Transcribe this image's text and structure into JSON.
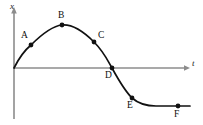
{
  "figure": {
    "kind": "line-graph",
    "background_color": "#ffffff",
    "axis_color": "#8c8c8c",
    "curve_color": "#111111",
    "marker_color": "#111111",
    "label_color": "#0d0d0d"
  },
  "axes": {
    "vertical": {
      "name": "x-axis",
      "label": "x",
      "label_x": 10,
      "label_y": 2,
      "line_x": 14,
      "line_top": 11,
      "line_bottom": 119,
      "has_arrow": true
    },
    "horizontal": {
      "name": "t-axis",
      "label": "t",
      "label_x": 192,
      "label_y": 59,
      "line_y": 68,
      "line_left": 14,
      "line_right": 189,
      "has_arrow": true
    },
    "origin": {
      "x": 14,
      "y": 68
    }
  },
  "chart_data": {
    "type": "line",
    "title": "",
    "xlabel": "t",
    "ylabel": "x",
    "grid": false,
    "legend": null,
    "xlim": [
      0,
      189
    ],
    "ylim": [
      -40,
      60
    ],
    "curve_description": "Displacement x versus time t: rises from the origin to a maximum, falls through zero, and levels off at a constant negative value.",
    "curve_path": "M 14,68 C 20,56 25,50 31,45 C 41,35 52,26 62,25 C 73,24 83,31 94,42 C 104,52 108,61 112,68 C 118,79 125,91 132,98 C 140,105 148,106 156,106 C 166,106 180,106 190,106",
    "points": [
      {
        "id": "A",
        "label": "A",
        "x": 31,
        "y": 45,
        "label_x": 21,
        "label_y": 31,
        "note": "rising, below maximum"
      },
      {
        "id": "B",
        "label": "B",
        "x": 62,
        "y": 25,
        "label_x": 58,
        "label_y": 11,
        "note": "maximum displacement"
      },
      {
        "id": "C",
        "label": "C",
        "x": 94,
        "y": 42,
        "label_x": 98,
        "label_y": 31,
        "note": "falling, above axis"
      },
      {
        "id": "D",
        "label": "D",
        "x": 112,
        "y": 68,
        "label_x": 105,
        "label_y": 71,
        "note": "crosses the t-axis, x = 0"
      },
      {
        "id": "E",
        "label": "E",
        "x": 132,
        "y": 98,
        "label_x": 127,
        "label_y": 101,
        "note": "falling, below axis"
      },
      {
        "id": "F",
        "label": "F",
        "x": 178,
        "y": 106,
        "label_x": 174,
        "label_y": 110,
        "note": "levelled off, constant negative x"
      }
    ],
    "marker_radius": 2.4
  }
}
